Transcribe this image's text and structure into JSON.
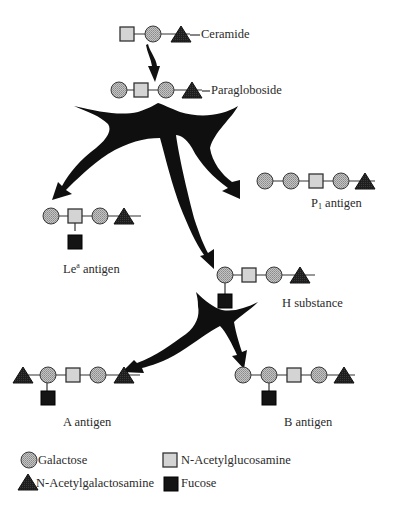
{
  "diagram": {
    "type": "glycosphingolipid biosynthesis pathway",
    "colors": {
      "galactose_fill": "#b5b5b5",
      "glcnac_fill": "#d2d2d2",
      "galnac_fill": "#1c1c1c",
      "fucose_fill": "#141414",
      "arrow_fill": "#111111",
      "line": "#333333"
    },
    "nodes": [
      {
        "id": "ceramide_precursor",
        "label": "Ceramide",
        "chain": [
          "glcnac",
          "galactose",
          "galnac"
        ]
      },
      {
        "id": "paragloboside",
        "label": "Paragloboside",
        "chain": [
          "galactose",
          "glcnac",
          "galactose",
          "galnac"
        ]
      },
      {
        "id": "p1_antigen",
        "label_main": "P",
        "label_sub": "1",
        "label_rest": " antigen",
        "chain": [
          "galactose",
          "galactose",
          "glcnac",
          "galactose",
          "galnac"
        ]
      },
      {
        "id": "lea_antigen",
        "label_main": "Le",
        "label_sup": "a",
        "label_rest": " antigen",
        "chain": [
          "galactose",
          "glcnac",
          "galactose",
          "galnac"
        ],
        "branch": {
          "on": "glcnac",
          "residue": "fucose"
        }
      },
      {
        "id": "h_substance",
        "label": "H substance",
        "chain": [
          "galactose",
          "glcnac",
          "galactose",
          "galnac"
        ],
        "branch": {
          "on": "galactose",
          "residue": "fucose"
        }
      },
      {
        "id": "a_antigen",
        "label": "A antigen",
        "chain": [
          "galnac",
          "galactose",
          "glcnac",
          "galactose",
          "galnac"
        ],
        "branch": {
          "on": "galactose",
          "residue": "fucose"
        }
      },
      {
        "id": "b_antigen",
        "label": "B antigen",
        "chain": [
          "galactose",
          "galactose",
          "glcnac",
          "galactose",
          "galnac"
        ],
        "branch": {
          "on": "galactose",
          "residue": "fucose"
        }
      }
    ],
    "edges": [
      {
        "from": "ceramide_precursor",
        "to": "paragloboside"
      },
      {
        "from": "paragloboside",
        "to": "lea_antigen"
      },
      {
        "from": "paragloboside",
        "to": "p1_antigen"
      },
      {
        "from": "paragloboside",
        "to": "h_substance"
      },
      {
        "from": "h_substance",
        "to": "a_antigen"
      },
      {
        "from": "h_substance",
        "to": "b_antigen"
      }
    ]
  },
  "labels": {
    "ceramide": "Ceramide",
    "paragloboside": "Paragloboside",
    "p1_main": "P",
    "p1_sub": "1",
    "p1_rest": " antigen",
    "lea_main": "Le",
    "lea_sup": "a",
    "lea_rest": " antigen",
    "h_substance": "H substance",
    "a_antigen": "A antigen",
    "b_antigen": "B antigen"
  },
  "legend": {
    "items": [
      {
        "symbol": "circle-stippled",
        "label": "Galactose"
      },
      {
        "symbol": "square-light",
        "label": "N-Acetylglucosamine"
      },
      {
        "symbol": "triangle-dark",
        "label": "N-Acetylgalactosamine"
      },
      {
        "symbol": "square-black",
        "label": "Fucose"
      }
    ]
  }
}
